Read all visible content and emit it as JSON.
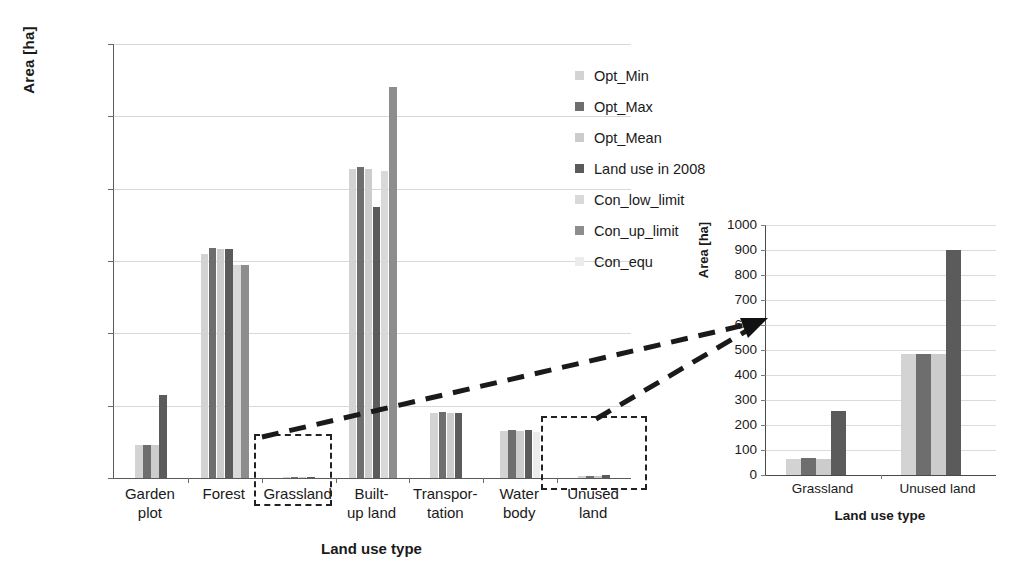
{
  "chart_data": [
    {
      "id": "main",
      "type": "bar",
      "title": "",
      "xlabel": "Land use type",
      "ylabel": "Area [ha]",
      "ylim": [
        0,
        120000
      ],
      "ytick_step": 20000,
      "yticks": [
        "120000",
        "100000",
        "80000",
        "60000",
        "40000",
        "20000",
        "0"
      ],
      "grid": true,
      "legend_position": "right",
      "categories": [
        "Garden plot",
        "Forest",
        "Grassland",
        "Built-up land",
        "Transpor- tation",
        "Water body",
        "Unused land"
      ],
      "category_lines": [
        [
          "Garden",
          "plot"
        ],
        [
          "Forest"
        ],
        [
          "Grassland"
        ],
        [
          "Built-",
          "up land"
        ],
        [
          "Transpor-",
          "tation"
        ],
        [
          "Water",
          "body"
        ],
        [
          "Unused",
          "land"
        ]
      ],
      "series": [
        {
          "name": "Opt_Min",
          "color": "#d3d3d3",
          "values": [
            9200,
            62000,
            65,
            85500,
            18000,
            13000,
            485
          ]
        },
        {
          "name": "Opt_Max",
          "color": "#6e6e6e",
          "values": [
            9200,
            63500,
            68,
            86000,
            18200,
            13400,
            485
          ]
        },
        {
          "name": "Opt_Mean",
          "color": "#cccccc",
          "values": [
            9200,
            63400,
            65,
            85500,
            18000,
            13100,
            485
          ]
        },
        {
          "name": "Land use in 2008",
          "color": "#5b5b5b",
          "values": [
            23000,
            63400,
            258,
            74800,
            18000,
            13300,
            900
          ]
        },
        {
          "name": "Con_low_limit",
          "color": "#d9d9d9",
          "values": [
            0,
            59000,
            0,
            85000,
            0,
            0,
            0
          ]
        },
        {
          "name": "Con_up_limit",
          "color": "#8d8d8d",
          "values": [
            0,
            59000,
            0,
            108000,
            0,
            0,
            0
          ]
        },
        {
          "name": "Con_equ",
          "color": "#ececec",
          "values": [
            0,
            0,
            0,
            0,
            0,
            12600,
            0
          ]
        }
      ]
    },
    {
      "id": "inset",
      "type": "bar",
      "title": "",
      "xlabel": "Land use type",
      "ylabel": "Area [ha]",
      "ylim": [
        0,
        1000
      ],
      "ytick_step": 100,
      "yticks": [
        "1000",
        "900",
        "800",
        "700",
        "600",
        "500",
        "400",
        "300",
        "200",
        "100",
        "0"
      ],
      "grid": true,
      "categories": [
        "Grassland",
        "Unused land"
      ],
      "series": [
        {
          "name": "Opt_Min",
          "color": "#d3d3d3",
          "values": [
            65,
            485
          ]
        },
        {
          "name": "Opt_Max",
          "color": "#6e6e6e",
          "values": [
            68,
            485
          ]
        },
        {
          "name": "Opt_Mean",
          "color": "#cccccc",
          "values": [
            65,
            485
          ]
        },
        {
          "name": "Land use in 2008",
          "color": "#5b5b5b",
          "values": [
            258,
            900
          ]
        }
      ]
    }
  ],
  "legend": {
    "items": [
      {
        "label": "Opt_Min",
        "color": "#d3d3d3"
      },
      {
        "label": "Opt_Max",
        "color": "#6e6e6e"
      },
      {
        "label": "Opt_Mean",
        "color": "#cccccc"
      },
      {
        "label": "Land use in 2008",
        "color": "#5b5b5b"
      },
      {
        "label": "Con_low_limit",
        "color": "#d9d9d9"
      },
      {
        "label": "Con_up_limit",
        "color": "#8d8d8d"
      },
      {
        "label": "Con_equ",
        "color": "#ececec"
      }
    ]
  },
  "annotations": {
    "callout_boxes": [
      "grassland-callout",
      "unused-land-callout"
    ],
    "arrow": "dashed-magnifier-arrow"
  }
}
